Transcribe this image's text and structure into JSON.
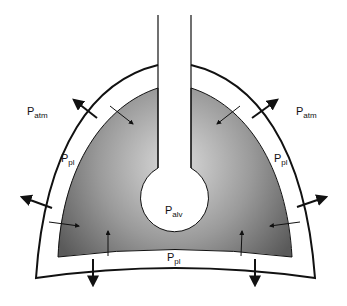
{
  "diagram": {
    "labels": {
      "patm_left": {
        "main": "P",
        "sub": "atm"
      },
      "patm_right": {
        "main": "P",
        "sub": "atm"
      },
      "ppl_left": {
        "main": "P",
        "sub": "pl"
      },
      "ppl_right": {
        "main": "P",
        "sub": "pl"
      },
      "ppl_bottom": {
        "main": "P",
        "sub": "pl"
      },
      "palv": {
        "main": "P",
        "sub": "alv"
      }
    },
    "colors": {
      "lung_dark": "#5e5e5e",
      "lung_light": "#d6d6d6",
      "stroke": "#111111",
      "background": "#ffffff"
    }
  }
}
